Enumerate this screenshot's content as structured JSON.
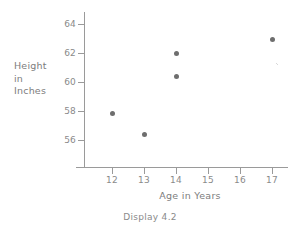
{
  "caption": "Display 4.2",
  "chart_data": {
    "type": "scatter",
    "title": "",
    "xlabel": "Age in Years",
    "ylabel": "Height in Inches",
    "ylabel_lines": [
      "Height",
      "in",
      "Inches"
    ],
    "x": [
      12,
      13,
      14,
      14,
      17
    ],
    "y": [
      57.8,
      56.4,
      62.0,
      60.4,
      62.9
    ],
    "points": [
      {
        "x": 12,
        "y": 57.8
      },
      {
        "x": 13,
        "y": 56.4
      },
      {
        "x": 14,
        "y": 62.0
      },
      {
        "x": 14,
        "y": 60.4
      },
      {
        "x": 17,
        "y": 62.9
      }
    ],
    "xticks": [
      12,
      13,
      14,
      15,
      16,
      17
    ],
    "yticks": [
      56,
      58,
      60,
      62,
      64
    ],
    "xtick_labels": [
      "12",
      "13",
      "14",
      "15",
      "16",
      "17"
    ],
    "ytick_labels": [
      "56",
      "58",
      "60",
      "62",
      "64"
    ],
    "xlim": [
      11.3,
      17.7
    ],
    "ylim": [
      54.6,
      64.9
    ],
    "grid": false,
    "legend": null,
    "marker": "circle",
    "marker_color": "#6e6e6e",
    "axis_color": "#9a9a9a",
    "text_color": "#8a8a8a"
  }
}
